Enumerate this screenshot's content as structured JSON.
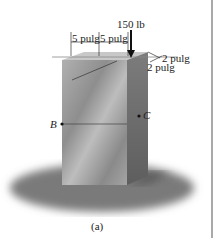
{
  "figure": {
    "caption": "(a)",
    "load": {
      "label": "150 lb",
      "direction": "down"
    },
    "dimensions": {
      "top_left": "5 pulg",
      "top_right": "5 pulg",
      "right_upper": "2 pulg",
      "right_lower": "2 pulg"
    },
    "points": {
      "B": "B",
      "C": "C"
    },
    "colors": {
      "front_face": "#9a9a9a",
      "side_face": "#6e6e6e",
      "top_face": "#c4c4c4",
      "shadow": "#7a7a7a",
      "lines": "#333333",
      "border": "#555555"
    }
  }
}
